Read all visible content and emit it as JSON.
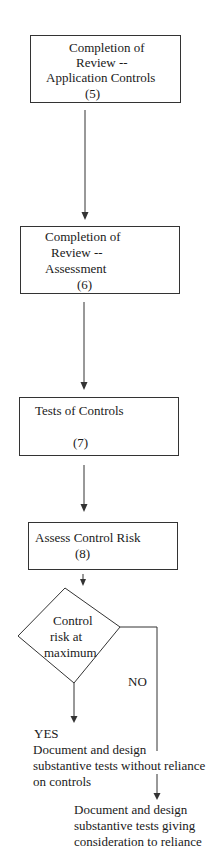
{
  "diagram": {
    "type": "flowchart",
    "colors": {
      "line": "#333333",
      "text": "#1a1a1a",
      "background": "#ffffff"
    },
    "nodes": [
      {
        "id": "step5",
        "shape": "rectangle",
        "lines": [
          "Completion of",
          "Review --",
          "Application Controls",
          "(5)"
        ]
      },
      {
        "id": "step6",
        "shape": "rectangle",
        "lines": [
          "Completion of",
          "Review --",
          "Assessment",
          "(6)"
        ]
      },
      {
        "id": "step7",
        "shape": "rectangle",
        "lines": [
          "Tests of Controls",
          "(7)"
        ]
      },
      {
        "id": "step8",
        "shape": "rectangle",
        "lines": [
          "Assess Control Risk",
          "(8)"
        ]
      },
      {
        "id": "decision",
        "shape": "diamond",
        "lines": [
          "Control",
          "risk at",
          "maximum"
        ]
      },
      {
        "id": "outcome_yes",
        "shape": "text",
        "label": "YES",
        "lines": [
          "Document and design",
          "substantive tests without reliance",
          "on controls"
        ]
      },
      {
        "id": "outcome_no",
        "shape": "text",
        "lines": [
          "Document and design",
          "substantive tests giving",
          "consideration to reliance"
        ]
      }
    ],
    "edges": [
      {
        "from": "step5",
        "to": "step6"
      },
      {
        "from": "step6",
        "to": "step7"
      },
      {
        "from": "step7",
        "to": "step8"
      },
      {
        "from": "step8",
        "to": "decision"
      },
      {
        "from": "decision",
        "to": "outcome_yes",
        "label": "YES"
      },
      {
        "from": "decision",
        "to": "outcome_no",
        "label": "NO"
      }
    ],
    "labels": {
      "no": "NO"
    }
  }
}
